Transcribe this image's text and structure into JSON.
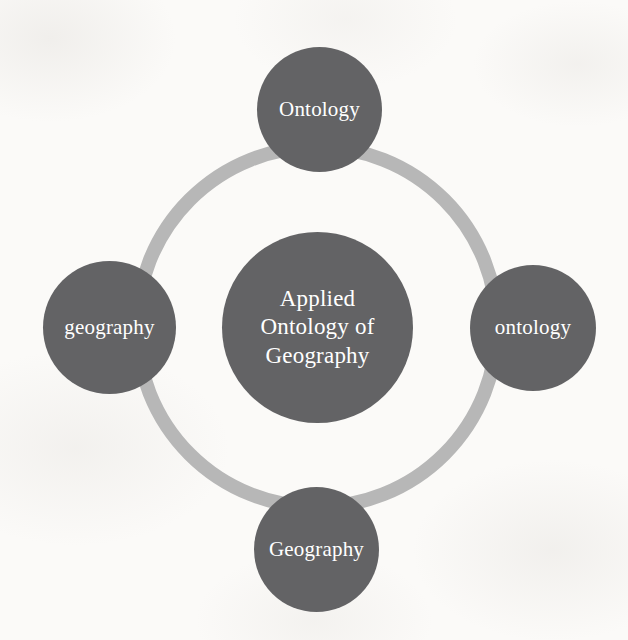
{
  "figure": {
    "title": "Applied Ontology of Geography",
    "kind": "circular-hub-and-spoke-diagram",
    "background_color": "#fbfaf8",
    "node_fill_color": "#636365",
    "node_text_color": "#ffffff",
    "ring_color": "#b7b7b7"
  },
  "center": {
    "label": "Applied\nOntology of\nGeography"
  },
  "nodes": {
    "top": {
      "label": "Ontology"
    },
    "right": {
      "label": "ontology"
    },
    "bottom": {
      "label": "Geography"
    },
    "left": {
      "label": "geography"
    }
  },
  "chart_data": {
    "type": "diagram",
    "title": "Applied Ontology of Geography",
    "center_label": "Applied Ontology of Geography",
    "ring": {
      "color": "#b7b7b7",
      "thickness_px": 14,
      "center": [
        317,
        327
      ],
      "radius_px": 187
    },
    "categories": [
      "Ontology",
      "ontology",
      "Geography",
      "geography"
    ],
    "items": [
      {
        "label": "Ontology",
        "position": "top",
        "center": [
          319,
          110
        ],
        "diameter_px": 125
      },
      {
        "label": "ontology",
        "position": "right",
        "center": [
          533,
          328
        ],
        "diameter_px": 126
      },
      {
        "label": "Geography",
        "position": "bottom",
        "center": [
          317,
          550
        ],
        "diameter_px": 125
      },
      {
        "label": "geography",
        "position": "left",
        "center": [
          110,
          328
        ],
        "diameter_px": 133
      },
      {
        "label": "Applied Ontology of Geography",
        "position": "center",
        "center": [
          317,
          327
        ],
        "diameter_px": 191
      }
    ],
    "legend": [],
    "annotations": []
  }
}
